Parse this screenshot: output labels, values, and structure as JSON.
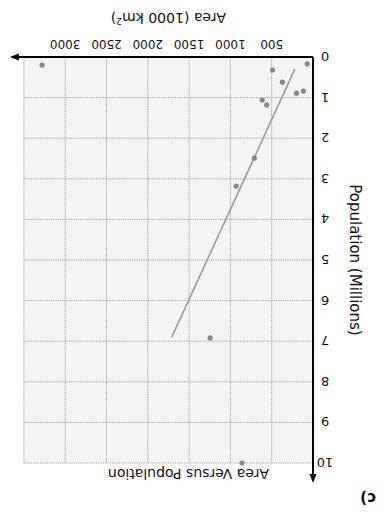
{
  "figure_label": "c)",
  "chart_data": {
    "type": "scatter",
    "title": "Area Versus Population",
    "xlabel": "Population (Millions)",
    "ylabel": "Area (1000 km²)",
    "ylabel_main": "Area (1000 km",
    "ylabel_sup": "2",
    "ylabel_close": ")",
    "x_ticks": [
      "0",
      "1",
      "2",
      "3",
      "4",
      "5",
      "6",
      "7",
      "8",
      "9",
      "10"
    ],
    "x_tick_display": [
      "0",
      "1",
      "2",
      "3",
      "4",
      "5",
      "6",
      "7",
      "8",
      "6",
      "01"
    ],
    "y_ticks": [
      "500",
      "1000",
      "1500",
      "2000",
      "2500",
      "3000"
    ],
    "xlim": [
      0,
      10
    ],
    "ylim": [
      0,
      3500
    ],
    "grid": true,
    "points": [
      {
        "x": 0.17,
        "y": 70
      },
      {
        "x": 0.2,
        "y": 3280
      },
      {
        "x": 0.32,
        "y": 490
      },
      {
        "x": 0.62,
        "y": 370
      },
      {
        "x": 0.84,
        "y": 115
      },
      {
        "x": 0.89,
        "y": 200
      },
      {
        "x": 1.06,
        "y": 615
      },
      {
        "x": 1.18,
        "y": 560
      },
      {
        "x": 2.49,
        "y": 710
      },
      {
        "x": 3.18,
        "y": 930
      },
      {
        "x": 6.92,
        "y": 1245
      },
      {
        "x": 10.0,
        "y": 860
      }
    ],
    "trend_line": {
      "x0": 0.3,
      "y0": 220,
      "x1": 6.9,
      "y1": 1710
    },
    "colors": {
      "points": "#888888",
      "trend": "#999999",
      "grid": "#9a9a9a",
      "axis": "#000000",
      "background": "#f4f4f4"
    }
  }
}
